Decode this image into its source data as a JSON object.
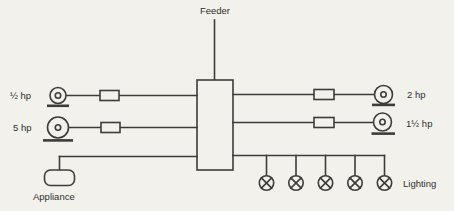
{
  "labels": {
    "feeder": "Feeder"
  },
  "left_branches": [
    {
      "label": "½ hp",
      "type": "motor"
    },
    {
      "label": "5 hp",
      "type": "motor"
    },
    {
      "label": "Appliance",
      "type": "appliance"
    }
  ],
  "right_branches": [
    {
      "label": "2 hp",
      "type": "motor"
    },
    {
      "label": "1½ hp",
      "type": "motor"
    },
    {
      "label": "Lighting",
      "type": "lighting-circuit",
      "lamp_count": 5
    }
  ],
  "colors": {
    "background": "#f2f1ec",
    "line": "#3c3c3a",
    "text": "#2f2f2d"
  }
}
